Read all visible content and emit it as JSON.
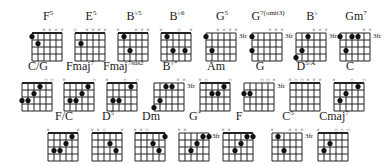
{
  "chords": [
    {
      "id": "F5",
      "root": "F",
      "sup": "5",
      "x": 28,
      "y": 12,
      "top": "  xxxx",
      "dots": [
        [
          0,
          1
        ],
        [
          1,
          2
        ]
      ],
      "fret": null
    },
    {
      "id": "E5",
      "root": "E",
      "sup": "5",
      "x": 71,
      "y": 12,
      "top": "o xxxx",
      "dots": [
        [
          1,
          2
        ]
      ],
      "fret": null
    },
    {
      "id": "Bb5",
      "root": "B",
      "sup": "b5",
      "x": 114,
      "y": 12,
      "top": "x  xxx",
      "dots": [
        [
          1,
          1
        ],
        [
          2,
          3
        ]
      ],
      "fret": null
    },
    {
      "id": "Bb6",
      "root": "B",
      "sup": "b6",
      "x": 157,
      "y": 12,
      "top": "x  o x",
      "dots": [
        [
          1,
          1
        ],
        [
          2,
          3
        ],
        [
          4,
          3
        ]
      ],
      "fret": null
    },
    {
      "id": "G5",
      "root": "G",
      "sup": "5",
      "x": 202,
      "y": 12,
      "top": "  xxxx",
      "dots": [
        [
          0,
          1
        ],
        [
          1,
          3
        ]
      ],
      "fret": "3fr"
    },
    {
      "id": "G7omit3",
      "root": "G",
      "sup": "7(omit3)",
      "x": 248,
      "y": 12,
      "top": "   xxx",
      "dots": [
        [
          0,
          1
        ],
        [
          0,
          3
        ]
      ],
      "fret": "3fr"
    },
    {
      "id": "Bb",
      "root": "B",
      "sup": "b",
      "x": 292,
      "y": 12,
      "top": "   xxx",
      "dots": [
        [
          0,
          4
        ],
        [
          1,
          3
        ],
        [
          2,
          1
        ]
      ],
      "fret": "3fr"
    },
    {
      "id": "Gm7",
      "root": "Gm",
      "sup": "7",
      "x": 336,
      "y": 12,
      "top": "    xx",
      "dots": [
        [
          0,
          1
        ],
        [
          2,
          1
        ],
        [
          3,
          1
        ],
        [
          1,
          3
        ]
      ],
      "fret": "3fr"
    },
    {
      "id": "C/G",
      "root": "C/G",
      "sup": "",
      "x": 18,
      "y": 62,
      "top": "    oo",
      "dots": [
        [
          0,
          3
        ],
        [
          1,
          3
        ],
        [
          2,
          2
        ],
        [
          3,
          1
        ]
      ],
      "fret": null
    },
    {
      "id": "Fmaj7",
      "root": "Fmaj",
      "sup": "7",
      "x": 60,
      "y": 62,
      "top": "x    o",
      "dots": [
        [
          1,
          3
        ],
        [
          2,
          3
        ],
        [
          3,
          2
        ],
        [
          4,
          1
        ]
      ],
      "fret": null
    },
    {
      "id": "Fmaj7sus2",
      "root": "Fmaj",
      "sup": "7sus2",
      "x": 103,
      "y": 62,
      "top": "x  o o",
      "dots": [
        [
          1,
          3
        ],
        [
          2,
          3
        ],
        [
          4,
          1
        ]
      ],
      "fret": null
    },
    {
      "id": "Bb*",
      "root": "B",
      "sup": "b*",
      "x": 150,
      "y": 62,
      "top": "    xx",
      "dots": [
        [
          0,
          4
        ],
        [
          1,
          3
        ],
        [
          2,
          1
        ],
        [
          3,
          1
        ]
      ],
      "fret": "3fr"
    },
    {
      "id": "Am",
      "root": "Am",
      "sup": "",
      "x": 196,
      "y": 62,
      "top": "xo   o",
      "dots": [
        [
          2,
          2
        ],
        [
          3,
          2
        ],
        [
          4,
          1
        ]
      ],
      "fret": null
    },
    {
      "id": "G",
      "root": "G",
      "sup": "",
      "x": 240,
      "y": 62,
      "top": "   oox",
      "dots": [
        [
          0,
          2
        ],
        [
          1,
          2
        ]
      ],
      "fret": "3fr"
    },
    {
      "id": "D5/A",
      "root": "D",
      "sup": "5/A",
      "x": 286,
      "y": 62,
      "top": "xooxxx",
      "dots": [],
      "fret": null
    },
    {
      "id": "C",
      "root": "C",
      "sup": "",
      "x": 330,
      "y": 62,
      "top": "x  o o",
      "dots": [
        [
          1,
          3
        ],
        [
          2,
          2
        ],
        [
          4,
          1
        ]
      ],
      "fret": null
    },
    {
      "id": "F/C",
      "root": "F/C",
      "sup": "",
      "x": 44,
      "y": 112,
      "top": "x    x",
      "dots": [
        [
          1,
          3
        ],
        [
          2,
          3
        ],
        [
          3,
          2
        ],
        [
          4,
          1
        ]
      ],
      "fret": null
    },
    {
      "id": "D5",
      "root": "D",
      "sup": "5",
      "x": 88,
      "y": 112,
      "top": "xxo  x",
      "dots": [
        [
          3,
          2
        ],
        [
          4,
          3
        ]
      ],
      "fret": null
    },
    {
      "id": "Dm",
      "root": "Dm",
      "sup": "",
      "x": 131,
      "y": 112,
      "top": "xxo   ",
      "dots": [
        [
          3,
          2
        ],
        [
          4,
          3
        ],
        [
          5,
          1
        ]
      ],
      "fret": null
    },
    {
      "id": "G*",
      "root": "G",
      "sup": "*",
      "x": 175,
      "y": 112,
      "top": "xx    ",
      "dots": [
        [
          2,
          3
        ],
        [
          3,
          2
        ],
        [
          4,
          1
        ],
        [
          5,
          1
        ]
      ],
      "fret": "3fr"
    },
    {
      "id": "F",
      "root": "F",
      "sup": "",
      "x": 219,
      "y": 112,
      "top": "xx    ",
      "dots": [
        [
          2,
          3
        ],
        [
          3,
          2
        ],
        [
          4,
          1
        ],
        [
          5,
          1
        ]
      ],
      "fret": null
    },
    {
      "id": "C5",
      "root": "C",
      "sup": "5",
      "x": 268,
      "y": 112,
      "top": "x  xxx",
      "dots": [
        [
          1,
          1
        ],
        [
          2,
          3
        ]
      ],
      "fret": "3fr"
    },
    {
      "id": "Cmaj7",
      "root": "Cmaj",
      "sup": "7",
      "x": 314,
      "y": 112,
      "top": "x  ooo",
      "dots": [
        [
          1,
          3
        ],
        [
          2,
          2
        ]
      ],
      "fret": null
    }
  ]
}
